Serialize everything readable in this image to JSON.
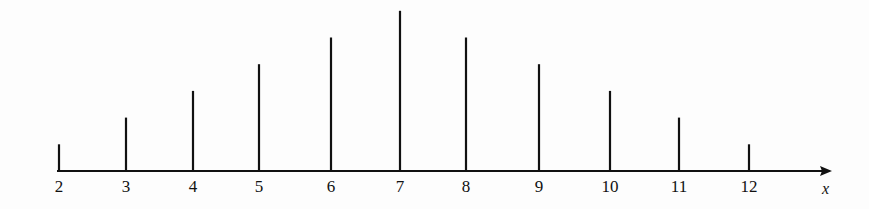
{
  "chart_data": {
    "type": "bar",
    "style": "stem",
    "title": "",
    "xlabel": "x",
    "ylabel": "",
    "categories": [
      "2",
      "3",
      "4",
      "5",
      "6",
      "7",
      "8",
      "9",
      "10",
      "11",
      "12"
    ],
    "values": [
      1,
      2,
      3,
      4,
      5,
      6,
      5,
      4,
      3,
      2,
      1
    ],
    "ylim": [
      0,
      6
    ],
    "grid": false,
    "legend": null
  },
  "layout": {
    "x_positions": [
      59,
      126,
      193,
      259,
      331,
      400,
      466,
      539,
      610,
      679,
      749
    ],
    "axis_y": 171,
    "unit_px": 26.7,
    "axis_start": 57,
    "axis_end": 832,
    "color": "#111111"
  }
}
